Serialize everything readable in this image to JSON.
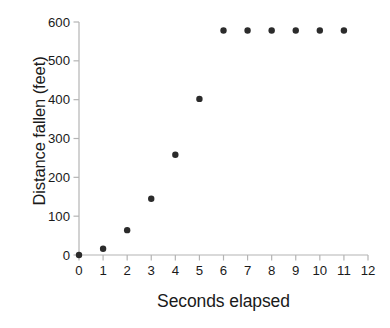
{
  "chart_data": {
    "type": "scatter",
    "title": "",
    "xlabel": "Seconds elapsed",
    "ylabel": "Distance fallen (feet)",
    "xlim": [
      0,
      12
    ],
    "ylim": [
      0,
      600
    ],
    "xticks": [
      0,
      1,
      2,
      3,
      4,
      5,
      6,
      7,
      8,
      9,
      10,
      11,
      12
    ],
    "xticklabels": [
      "0",
      "1",
      "2",
      "3",
      "4",
      "5",
      "6",
      "7",
      "8",
      "9",
      "10",
      "11",
      "12"
    ],
    "yticks": [
      0,
      100,
      200,
      300,
      400,
      500,
      600
    ],
    "yticklabels": [
      "0",
      "100",
      "200",
      "300",
      "400",
      "500",
      "600"
    ],
    "grid": false,
    "legend": null,
    "marker": "circle",
    "marker_color": "#2b2b2b",
    "marker_size_px": 6.4,
    "axis_color": "#b4b4b4",
    "background_color": "#ffffff",
    "x": [
      0,
      1,
      2,
      3,
      4,
      5,
      6,
      7,
      8,
      9,
      10,
      11
    ],
    "y": [
      0,
      16,
      64,
      145,
      258,
      402,
      578,
      578,
      578,
      578,
      578,
      578
    ],
    "points": [
      {
        "x": 0,
        "y": 0
      },
      {
        "x": 1,
        "y": 16
      },
      {
        "x": 2,
        "y": 64
      },
      {
        "x": 3,
        "y": 145
      },
      {
        "x": 4,
        "y": 258
      },
      {
        "x": 5,
        "y": 402
      },
      {
        "x": 6,
        "y": 578
      },
      {
        "x": 7,
        "y": 578
      },
      {
        "x": 8,
        "y": 578
      },
      {
        "x": 9,
        "y": 578
      },
      {
        "x": 10,
        "y": 578
      },
      {
        "x": 11,
        "y": 578
      }
    ]
  }
}
